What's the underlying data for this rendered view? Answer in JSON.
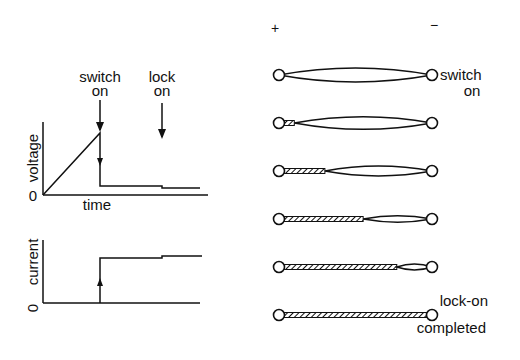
{
  "graphs": {
    "annotation_switch_line1": "switch",
    "annotation_switch_line2": "on",
    "annotation_lock_line1": "lock",
    "annotation_lock_line2": "on",
    "voltage": {
      "ylabel": "voltage",
      "xlabel": "time",
      "origin": "0"
    },
    "current": {
      "ylabel": "current",
      "origin": "0"
    }
  },
  "sequence": {
    "plus_label": "+",
    "minus_label": "−",
    "switch_label_line1": "switch",
    "switch_label_line2": "on",
    "lockon_label_line1": "lock-on",
    "lockon_label_line2": "completed",
    "stages": [
      {
        "filament_fraction": 0.0
      },
      {
        "filament_fraction": 0.1
      },
      {
        "filament_fraction": 0.3
      },
      {
        "filament_fraction": 0.55
      },
      {
        "filament_fraction": 0.77
      },
      {
        "filament_fraction": 1.0
      }
    ]
  },
  "colors": {
    "ink": "#111111",
    "background": "#ffffff"
  }
}
